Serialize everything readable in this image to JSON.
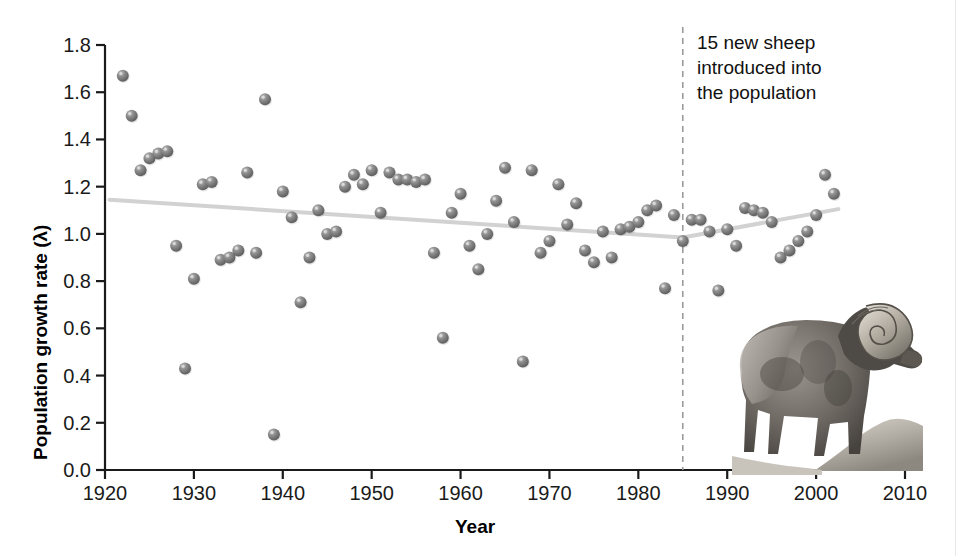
{
  "figure": {
    "background_color": "#ffffff",
    "point_color": "#7a7a7a",
    "trendline_color": "#d2d2d2",
    "axis_color": "#1a1a1a"
  },
  "axes": {
    "ylabel": "Population growth rate (λ)",
    "xlabel": "Year",
    "yticks": [
      "0.0",
      "0.2",
      "0.4",
      "0.6",
      "0.8",
      "1.0",
      "1.2",
      "1.4",
      "1.6",
      "1.8"
    ],
    "xticks": [
      "1920",
      "1930",
      "1940",
      "1950",
      "1960",
      "1970",
      "1980",
      "1990",
      "2000",
      "2010"
    ]
  },
  "annotation": {
    "line1": "15 new sheep",
    "line2": "introduced into",
    "line3": "the population",
    "event_year": 1985
  },
  "illustration": {
    "name": "bighorn-sheep-photo",
    "caption": "bighorn ram standing on rocky outcrop"
  },
  "chart_data": {
    "type": "scatter",
    "title": "",
    "xlabel": "Year",
    "ylabel": "Population growth rate (λ)",
    "xlim": [
      1920,
      2010
    ],
    "ylim": [
      0.0,
      1.8
    ],
    "grid": false,
    "legend": null,
    "series": [
      {
        "name": "Annual population growth rate",
        "marker": "sphere",
        "color": "#7a7a7a",
        "points": [
          [
            1922,
            1.67
          ],
          [
            1923,
            1.5
          ],
          [
            1924,
            1.27
          ],
          [
            1925,
            1.32
          ],
          [
            1926,
            1.34
          ],
          [
            1927,
            1.35
          ],
          [
            1928,
            0.95
          ],
          [
            1929,
            0.43
          ],
          [
            1930,
            0.81
          ],
          [
            1931,
            1.21
          ],
          [
            1932,
            1.22
          ],
          [
            1933,
            0.89
          ],
          [
            1934,
            0.9
          ],
          [
            1935,
            0.93
          ],
          [
            1936,
            1.26
          ],
          [
            1937,
            0.92
          ],
          [
            1938,
            1.57
          ],
          [
            1939,
            0.15
          ],
          [
            1940,
            1.18
          ],
          [
            1941,
            1.07
          ],
          [
            1942,
            0.71
          ],
          [
            1943,
            0.9
          ],
          [
            1944,
            1.1
          ],
          [
            1945,
            1.0
          ],
          [
            1946,
            1.01
          ],
          [
            1947,
            1.2
          ],
          [
            1948,
            1.25
          ],
          [
            1949,
            1.21
          ],
          [
            1950,
            1.27
          ],
          [
            1951,
            1.09
          ],
          [
            1952,
            1.26
          ],
          [
            1953,
            1.23
          ],
          [
            1954,
            1.23
          ],
          [
            1955,
            1.22
          ],
          [
            1956,
            1.23
          ],
          [
            1957,
            0.92
          ],
          [
            1958,
            0.56
          ],
          [
            1959,
            1.09
          ],
          [
            1960,
            1.17
          ],
          [
            1961,
            0.95
          ],
          [
            1962,
            0.85
          ],
          [
            1963,
            1.0
          ],
          [
            1964,
            1.14
          ],
          [
            1965,
            1.28
          ],
          [
            1966,
            1.05
          ],
          [
            1967,
            0.46
          ],
          [
            1968,
            1.27
          ],
          [
            1969,
            0.92
          ],
          [
            1970,
            0.97
          ],
          [
            1971,
            1.21
          ],
          [
            1972,
            1.04
          ],
          [
            1973,
            1.13
          ],
          [
            1974,
            0.93
          ],
          [
            1975,
            0.88
          ],
          [
            1976,
            1.01
          ],
          [
            1977,
            0.9
          ],
          [
            1978,
            1.02
          ],
          [
            1979,
            1.03
          ],
          [
            1980,
            1.05
          ],
          [
            1981,
            1.1
          ],
          [
            1982,
            1.12
          ],
          [
            1983,
            0.77
          ],
          [
            1984,
            1.08
          ],
          [
            1985,
            0.97
          ],
          [
            1986,
            1.06
          ],
          [
            1987,
            1.06
          ],
          [
            1988,
            1.01
          ],
          [
            1989,
            0.76
          ],
          [
            1990,
            1.02
          ],
          [
            1991,
            0.95
          ],
          [
            1992,
            1.11
          ],
          [
            1993,
            1.1
          ],
          [
            1994,
            1.09
          ],
          [
            1995,
            1.05
          ],
          [
            1996,
            0.9
          ],
          [
            1997,
            0.93
          ],
          [
            1998,
            0.97
          ],
          [
            1999,
            1.01
          ],
          [
            2000,
            1.08
          ],
          [
            2001,
            1.25
          ],
          [
            2002,
            1.17
          ]
        ]
      }
    ],
    "trendlines": [
      {
        "name": "pre-introduction-decline",
        "x_start": 1920.5,
        "y_start": 1.145,
        "x_end": 1985.0,
        "y_end": 0.985,
        "color": "#d2d2d2"
      },
      {
        "name": "post-introduction-increase",
        "x_start": 1985.0,
        "y_start": 0.985,
        "x_end": 2002.5,
        "y_end": 1.105,
        "color": "#d2d2d2"
      }
    ],
    "reference_lines": [
      {
        "name": "sheep-introduction-event",
        "orientation": "vertical",
        "x": 1985,
        "style": "dashed",
        "color": "#9a9a9a"
      }
    ]
  }
}
